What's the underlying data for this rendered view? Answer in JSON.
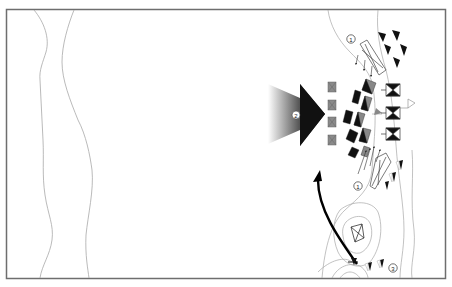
{
  "diagram": {
    "type": "tactical-map",
    "colors": {
      "frame": "#6e6e6e",
      "terrain_line": "#a8a8a8",
      "unit_dark": "#111111",
      "unit_gray": "#8a8a8a",
      "arrow_dark": "#000000",
      "gradient_start": "#ffffff",
      "gradient_end": "#1a1a1a"
    },
    "markers": [
      {
        "id": "marker-1-top",
        "label": "1"
      },
      {
        "id": "marker-1-bottom",
        "label": "1"
      },
      {
        "id": "marker-2",
        "label": "2"
      },
      {
        "id": "marker-3",
        "label": "3"
      }
    ],
    "elements": {
      "main_attack_arrow": "Main attack arrow (gradient)",
      "flank_arrow": "Curved flanking arrow",
      "gray_blocks_count": 4,
      "hourglass_units_count": 3
    }
  }
}
